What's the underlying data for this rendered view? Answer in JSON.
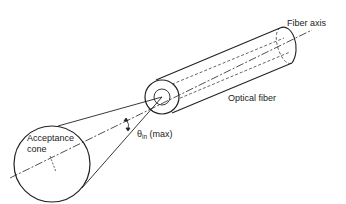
{
  "diagram": {
    "title": "Optical fiber acceptance cone",
    "labels": {
      "fiber_axis": "Fiber axis",
      "optical_fiber": "Optical fiber",
      "acceptance_line1": "Acceptance",
      "acceptance_line2": "cone",
      "theta_symbol": "θ",
      "theta_sub": "in",
      "theta_suffix": " (max)"
    },
    "colors": {
      "stroke": "#222222",
      "background": "#ffffff"
    }
  }
}
